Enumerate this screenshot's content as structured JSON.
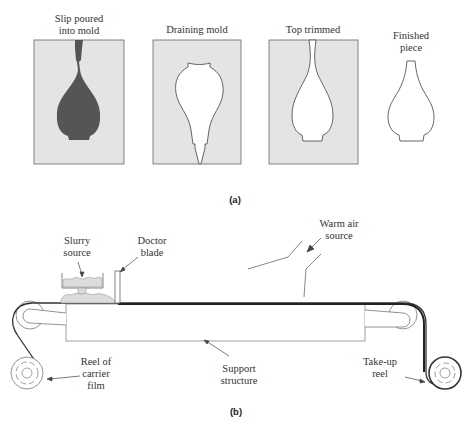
{
  "figure": {
    "part_a": {
      "caption": "(a)",
      "panels": [
        {
          "title_lines": [
            "Slip poured",
            "into mold"
          ],
          "state": "mold filled with slip"
        },
        {
          "title_lines": [
            "Draining mold"
          ],
          "state": "slip drained leaving shell"
        },
        {
          "title_lines": [
            "Top trimmed"
          ],
          "state": "top of piece trimmed"
        },
        {
          "title_lines": [
            "Finished",
            "piece"
          ],
          "state": "finished hollow piece"
        }
      ]
    },
    "part_b": {
      "caption": "(b)",
      "labels": {
        "slurry_source": [
          "Slurry",
          "source"
        ],
        "doctor_blade": [
          "Doctor",
          "blade"
        ],
        "warm_air_source": [
          "Warm air",
          "source"
        ],
        "reel_of_carrier_film": [
          "Reel of",
          "carrier",
          "film"
        ],
        "support_structure": [
          "Support",
          "structure"
        ],
        "take_up_reel": [
          "Take-up",
          "reel"
        ]
      }
    }
  },
  "colors": {
    "mold_fill": "#e4e4e4",
    "slip_fill": "#555555",
    "line": "#555555",
    "text": "#333333"
  }
}
